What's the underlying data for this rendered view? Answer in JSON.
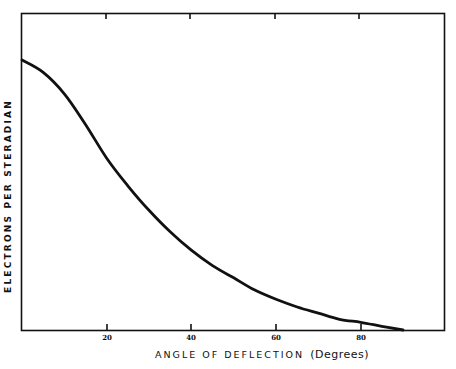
{
  "chart_data": {
    "type": "line",
    "title": "",
    "xlabel": "ANGLE OF DEFLECTION",
    "xlabel_unit": "(Degrees)",
    "ylabel": "ELECTRONS PER STERADIAN",
    "xlim": [
      0,
      100
    ],
    "ylim": [
      0,
      1
    ],
    "x_ticks": [
      20,
      40,
      60,
      80
    ],
    "x_tick_labels": [
      "20",
      "40",
      "60",
      "80"
    ],
    "y_ticks": [],
    "grid": false,
    "legend": null,
    "series": [
      {
        "name": "electrons per steradian",
        "x": [
          0,
          5,
          10,
          15,
          20,
          25,
          30,
          35,
          40,
          45,
          50,
          55,
          60,
          65,
          70,
          75,
          80,
          85,
          90
        ],
        "values": [
          0.88,
          0.84,
          0.77,
          0.67,
          0.56,
          0.47,
          0.39,
          0.32,
          0.26,
          0.21,
          0.17,
          0.13,
          0.1,
          0.075,
          0.055,
          0.035,
          0.025,
          0.012,
          0.0
        ]
      }
    ]
  },
  "colors": {
    "line": "#111111",
    "axis": "#111111",
    "background": "#ffffff"
  }
}
